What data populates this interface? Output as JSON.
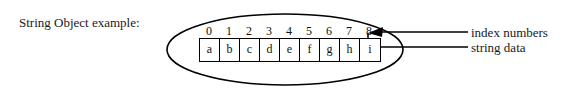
{
  "diagram": {
    "caption": "String Object example:",
    "indices": [
      "0",
      "1",
      "2",
      "3",
      "4",
      "5",
      "6",
      "7",
      "8"
    ],
    "characters": [
      "a",
      "b",
      "c",
      "d",
      "e",
      "f",
      "g",
      "h",
      "i"
    ],
    "annotations": {
      "index_numbers": "index numbers",
      "string_data": "string data"
    },
    "colors": {
      "background": "#ffffff",
      "stroke": "#000000",
      "text": "#1a1a1a"
    }
  }
}
